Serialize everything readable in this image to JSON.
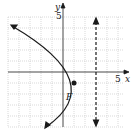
{
  "diagram": {
    "type": "parabola-graph",
    "axes": {
      "x_label": "x",
      "y_label": "y",
      "x_tick_label": "5",
      "y_tick_label": "5",
      "range": [
        -5,
        6
      ]
    },
    "parabola": {
      "vertex": [
        2,
        -1
      ],
      "opens": "left",
      "equation": "(y+1)^2 = -4(x-2)"
    },
    "focus": {
      "label": "F",
      "point": [
        1,
        -1
      ]
    },
    "directrix": {
      "equation": "x = 3",
      "style": "dashed"
    },
    "colors": {
      "grid": "#c8c8c8",
      "ink": "#1a1a1a"
    }
  }
}
